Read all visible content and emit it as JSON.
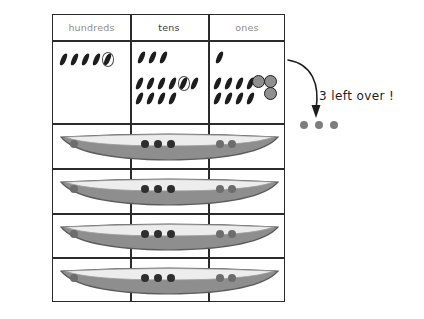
{
  "worksheet": {
    "title": "place-value division worksheet",
    "columns": [
      {
        "key": "hundreds",
        "label": "hundreds"
      },
      {
        "key": "tens",
        "label": "tens"
      },
      {
        "key": "ones",
        "label": "ones"
      }
    ],
    "counter_row": {
      "hundreds": {
        "top_group_count": 0,
        "bottom_group_count": 5,
        "circled_index": 5,
        "beads": 0
      },
      "tens": {
        "top_group_count": 3,
        "bottom_group_count": 10,
        "circled_index": 5,
        "beads": 0
      },
      "ones": {
        "top_group_count": 1,
        "bottom_group_count": 8,
        "circled_index": 0,
        "beads": 3
      }
    },
    "boat_rows": [
      {
        "hundreds_dots": 1,
        "tens_dots": 3,
        "ones_dots": 2
      },
      {
        "hundreds_dots": 1,
        "tens_dots": 3,
        "ones_dots": 2
      },
      {
        "hundreds_dots": 1,
        "tens_dots": 3,
        "ones_dots": 2
      },
      {
        "hundreds_dots": 1,
        "tens_dots": 3,
        "ones_dots": 2
      }
    ],
    "annotation": {
      "text": "3 left over !",
      "leftover_dot_count": 3
    },
    "colors": {
      "grid_line": "#2b2b2b",
      "header_text": "#8c8c8c",
      "header_text_emphasis": "#3a3a3a",
      "tally_mark": "#1d1d1d",
      "circle_outline": "#4c4c4c",
      "bead_fill": "#8f8f8f",
      "boat_hull": "#8e8e8e",
      "boat_deck": "#ededed",
      "boat_outline": "#5c5c5c",
      "boat_dot": "#2e2e2e",
      "boat_dot_light": "#6d6d6d",
      "leftover_dot": "#7d7d7d",
      "annotation_text": "#1d1d1d",
      "background": "#ffffff"
    }
  }
}
